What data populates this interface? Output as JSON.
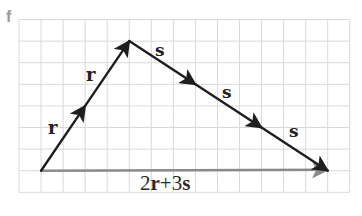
{
  "figure_label": "f",
  "colors": {
    "grid": "#d9d9d9",
    "vector": "#1e1e1e",
    "resultant": "#8a8a8a",
    "figure_label": "#9a9a9a"
  },
  "grid": {
    "columns": 15,
    "rows": 8
  },
  "vectors": [
    {
      "name": "r",
      "label": "r",
      "from": [
        1,
        7
      ],
      "to": [
        3,
        4
      ]
    },
    {
      "name": "r",
      "label": "r",
      "from": [
        3,
        4
      ],
      "to": [
        5,
        1
      ]
    },
    {
      "name": "s",
      "label": "s",
      "from": [
        5,
        1
      ],
      "to": [
        8,
        3
      ]
    },
    {
      "name": "s",
      "label": "s",
      "from": [
        8,
        3
      ],
      "to": [
        11,
        5
      ]
    },
    {
      "name": "s",
      "label": "s",
      "from": [
        11,
        5
      ],
      "to": [
        14,
        7
      ]
    }
  ],
  "resultant": {
    "from": [
      1,
      7
    ],
    "to": [
      14,
      7
    ],
    "label_parts": [
      "2",
      "r",
      "+3",
      "s"
    ]
  }
}
